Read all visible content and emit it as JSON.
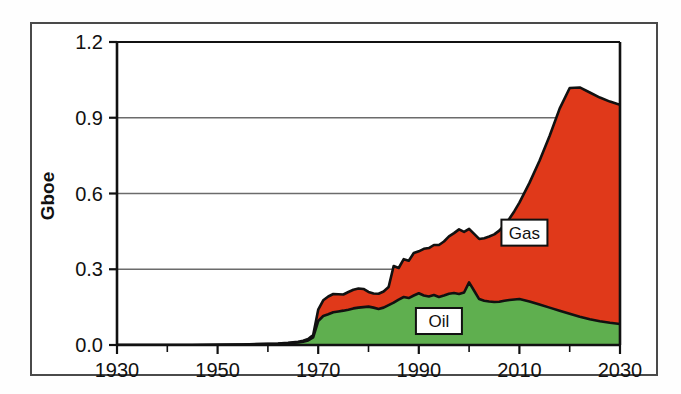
{
  "chart_data": {
    "type": "area",
    "stacked": true,
    "title": "",
    "subtitle": "",
    "xlabel": "",
    "ylabel": "Gboe",
    "xlim": [
      1930,
      2030
    ],
    "ylim": [
      0.0,
      1.2
    ],
    "xticks": [
      1930,
      1950,
      1970,
      1990,
      2010,
      2030
    ],
    "xtick_labels": [
      "1930",
      "1950",
      "1970",
      "1990",
      "2010",
      "2030"
    ],
    "xminor_tick_step": 10,
    "yticks": [
      0.0,
      0.3,
      0.6,
      0.9,
      1.2
    ],
    "ytick_labels": [
      "0.0",
      "0.3",
      "0.6",
      "0.9",
      "1.2"
    ],
    "grid": "horizontal",
    "legend_position": "inline-annotations",
    "colors": {
      "oil": "#5FAF4F",
      "gas": "#E0391A",
      "outline": "#111111",
      "gridline": "#6b6b6b",
      "frame": "#4a4a4a",
      "background": "#ffffff"
    },
    "x": [
      1930,
      1935,
      1940,
      1945,
      1950,
      1955,
      1960,
      1962,
      1964,
      1966,
      1967,
      1968,
      1969,
      1970,
      1971,
      1972,
      1973,
      1974,
      1975,
      1976,
      1977,
      1978,
      1979,
      1980,
      1981,
      1982,
      1983,
      1984,
      1985,
      1986,
      1987,
      1988,
      1989,
      1990,
      1991,
      1992,
      1993,
      1994,
      1995,
      1996,
      1997,
      1998,
      1999,
      2000,
      2001,
      2002,
      2003,
      2004,
      2005,
      2006,
      2007,
      2008,
      2009,
      2010,
      2012,
      2014,
      2016,
      2018,
      2020,
      2022,
      2024,
      2026,
      2028,
      2030
    ],
    "series": [
      {
        "name": "Oil",
        "label": "Oil",
        "color": "#5FAF4F",
        "values": [
          0.0,
          0.0,
          0.0,
          0.0,
          0.001,
          0.002,
          0.004,
          0.005,
          0.007,
          0.01,
          0.013,
          0.018,
          0.03,
          0.095,
          0.115,
          0.122,
          0.13,
          0.133,
          0.136,
          0.14,
          0.145,
          0.148,
          0.15,
          0.152,
          0.148,
          0.143,
          0.148,
          0.158,
          0.168,
          0.18,
          0.19,
          0.186,
          0.196,
          0.205,
          0.196,
          0.192,
          0.198,
          0.19,
          0.196,
          0.203,
          0.206,
          0.202,
          0.208,
          0.248,
          0.215,
          0.182,
          0.175,
          0.172,
          0.17,
          0.171,
          0.175,
          0.178,
          0.18,
          0.182,
          0.172,
          0.16,
          0.148,
          0.136,
          0.124,
          0.112,
          0.102,
          0.094,
          0.088,
          0.083
        ]
      },
      {
        "name": "Gas",
        "label": "Gas",
        "color": "#E0391A",
        "values": [
          0.0,
          0.0,
          0.0,
          0.0,
          0.0,
          0.0,
          0.001,
          0.001,
          0.002,
          0.003,
          0.004,
          0.006,
          0.01,
          0.045,
          0.062,
          0.07,
          0.072,
          0.068,
          0.064,
          0.07,
          0.074,
          0.076,
          0.072,
          0.058,
          0.056,
          0.06,
          0.064,
          0.072,
          0.145,
          0.125,
          0.15,
          0.148,
          0.168,
          0.166,
          0.185,
          0.192,
          0.198,
          0.206,
          0.214,
          0.227,
          0.237,
          0.256,
          0.24,
          0.212,
          0.225,
          0.238,
          0.248,
          0.258,
          0.268,
          0.282,
          0.3,
          0.322,
          0.35,
          0.382,
          0.47,
          0.57,
          0.68,
          0.8,
          0.894,
          0.908,
          0.898,
          0.886,
          0.876,
          0.868
        ]
      }
    ],
    "annotations": [
      {
        "text": "Gas",
        "x": 2011,
        "y": 0.445,
        "style": "boxed"
      },
      {
        "text": "Oil",
        "x": 1994,
        "y": 0.095,
        "style": "boxed"
      }
    ],
    "notes": {
      "oil_peak_year": 2000,
      "oil_peak_value": 0.25,
      "total_peak_year": 2021,
      "total_peak_value": 1.02,
      "total_end_2030": 0.95
    }
  },
  "axes": {
    "y_title": "Gboe"
  }
}
